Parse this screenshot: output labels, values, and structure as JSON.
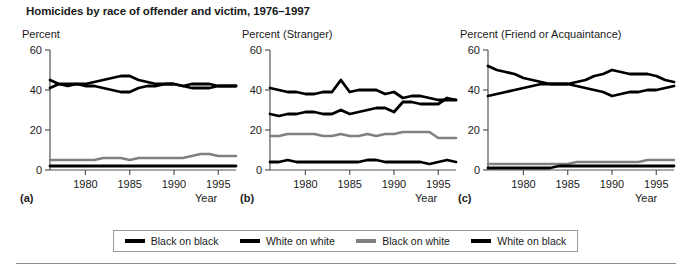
{
  "title": "Homicides by race of offender and victim, 1976–1997",
  "colors": {
    "black_on_black": "#000000",
    "white_on_white": "#000000",
    "black_on_white": "#808080",
    "white_on_black": "#000000",
    "axis": "#555555",
    "legend_border": "#9a9a9a"
  },
  "legend": {
    "items": [
      {
        "label": "Black on black",
        "color": "#000000"
      },
      {
        "label": "White on white",
        "color": "#000000"
      },
      {
        "label": "Black on white",
        "color": "#808080"
      },
      {
        "label": "White on black",
        "color": "#000000"
      }
    ]
  },
  "panels": [
    {
      "letter": "(a)",
      "axis_title": "Percent",
      "xlabel": "Year"
    },
    {
      "letter": "(b)",
      "axis_title": "Percent (Stranger)",
      "xlabel": "Year"
    },
    {
      "letter": "(c)",
      "axis_title": "Percent (Friend or Acquaintance)",
      "xlabel": "Year"
    }
  ],
  "chart_data": [
    {
      "type": "line",
      "panel": "(a)",
      "title": "Percent",
      "xlabel": "Year",
      "ylabel": "Percent",
      "xlim": [
        1976,
        1997
      ],
      "ylim": [
        0,
        60
      ],
      "yticks": [
        0,
        20,
        40,
        60
      ],
      "xticks": [
        1980,
        1985,
        1990,
        1995
      ],
      "grid": false,
      "legend_position": "bottom",
      "x": [
        1976,
        1977,
        1978,
        1979,
        1980,
        1981,
        1982,
        1983,
        1984,
        1985,
        1986,
        1987,
        1988,
        1989,
        1990,
        1991,
        1992,
        1993,
        1994,
        1995,
        1996,
        1997
      ],
      "series": [
        {
          "name": "Black on black",
          "color": "#000000",
          "values": [
            45,
            43,
            42,
            43,
            43,
            44,
            45,
            46,
            47,
            47,
            45,
            44,
            43,
            43,
            43,
            42,
            41,
            41,
            41,
            42,
            42,
            42
          ]
        },
        {
          "name": "White on white",
          "color": "#000000",
          "values": [
            41,
            43,
            43,
            43,
            42,
            42,
            41,
            40,
            39,
            39,
            41,
            42,
            42,
            43,
            43,
            42,
            43,
            43,
            43,
            42,
            42,
            42
          ]
        },
        {
          "name": "Black on white",
          "color": "#808080",
          "values": [
            5,
            5,
            5,
            5,
            5,
            5,
            6,
            6,
            6,
            5,
            6,
            6,
            6,
            6,
            6,
            6,
            7,
            8,
            8,
            7,
            7,
            7
          ]
        },
        {
          "name": "White on black",
          "color": "#000000",
          "values": [
            2,
            2,
            2,
            2,
            2,
            2,
            2,
            2,
            2,
            2,
            2,
            2,
            2,
            2,
            2,
            2,
            2,
            2,
            2,
            2,
            2,
            2
          ]
        }
      ]
    },
    {
      "type": "line",
      "panel": "(b)",
      "title": "Percent (Stranger)",
      "xlabel": "Year",
      "ylabel": "Percent (Stranger)",
      "xlim": [
        1976,
        1997
      ],
      "ylim": [
        0,
        60
      ],
      "yticks": [
        0,
        20,
        40,
        60
      ],
      "xticks": [
        1980,
        1985,
        1990,
        1995
      ],
      "grid": false,
      "legend_position": "bottom",
      "x": [
        1976,
        1977,
        1978,
        1979,
        1980,
        1981,
        1982,
        1983,
        1984,
        1985,
        1986,
        1987,
        1988,
        1989,
        1990,
        1991,
        1992,
        1993,
        1994,
        1995,
        1996,
        1997
      ],
      "series": [
        {
          "name": "Black on black",
          "color": "#000000",
          "values": [
            41,
            40,
            39,
            39,
            38,
            38,
            39,
            39,
            45,
            39,
            40,
            40,
            40,
            38,
            39,
            36,
            37,
            37,
            36,
            35,
            35,
            35
          ]
        },
        {
          "name": "White on white",
          "color": "#000000",
          "values": [
            28,
            27,
            28,
            28,
            29,
            29,
            28,
            28,
            30,
            28,
            29,
            30,
            31,
            31,
            29,
            34,
            34,
            33,
            33,
            33,
            36,
            35
          ]
        },
        {
          "name": "Black on white",
          "color": "#808080",
          "values": [
            17,
            17,
            18,
            18,
            18,
            18,
            17,
            17,
            18,
            17,
            17,
            18,
            17,
            18,
            18,
            19,
            19,
            19,
            19,
            16,
            16,
            16
          ]
        },
        {
          "name": "White on black",
          "color": "#000000",
          "values": [
            4,
            4,
            5,
            4,
            4,
            4,
            4,
            4,
            4,
            4,
            4,
            5,
            5,
            4,
            4,
            4,
            4,
            4,
            3,
            4,
            5,
            4
          ]
        }
      ]
    },
    {
      "type": "line",
      "panel": "(c)",
      "title": "Percent (Friend or Acquaintance)",
      "xlabel": "Year",
      "ylabel": "Percent (Friend or Acquaintance)",
      "xlim": [
        1976,
        1997
      ],
      "ylim": [
        0,
        60
      ],
      "yticks": [
        0,
        20,
        40,
        60
      ],
      "xticks": [
        1980,
        1985,
        1990,
        1995
      ],
      "grid": false,
      "legend_position": "bottom",
      "x": [
        1976,
        1977,
        1978,
        1979,
        1980,
        1981,
        1982,
        1983,
        1984,
        1985,
        1986,
        1987,
        1988,
        1989,
        1990,
        1991,
        1992,
        1993,
        1994,
        1995,
        1996,
        1997
      ],
      "series": [
        {
          "name": "Black on black",
          "color": "#000000",
          "values": [
            52,
            50,
            49,
            48,
            46,
            45,
            44,
            43,
            43,
            43,
            44,
            45,
            47,
            48,
            50,
            49,
            48,
            48,
            48,
            47,
            45,
            44
          ]
        },
        {
          "name": "White on white",
          "color": "#000000",
          "values": [
            37,
            38,
            39,
            40,
            41,
            42,
            43,
            43,
            43,
            43,
            42,
            41,
            40,
            39,
            37,
            38,
            39,
            39,
            40,
            40,
            41,
            42
          ]
        },
        {
          "name": "Black on white",
          "color": "#808080",
          "values": [
            3,
            3,
            3,
            3,
            3,
            3,
            3,
            3,
            3,
            3,
            4,
            4,
            4,
            4,
            4,
            4,
            4,
            4,
            5,
            5,
            5,
            5
          ]
        },
        {
          "name": "White on black",
          "color": "#000000",
          "values": [
            1,
            1,
            1,
            1,
            1,
            1,
            1,
            1,
            2,
            2,
            2,
            2,
            2,
            2,
            2,
            2,
            2,
            2,
            2,
            2,
            2,
            2
          ]
        }
      ]
    }
  ]
}
